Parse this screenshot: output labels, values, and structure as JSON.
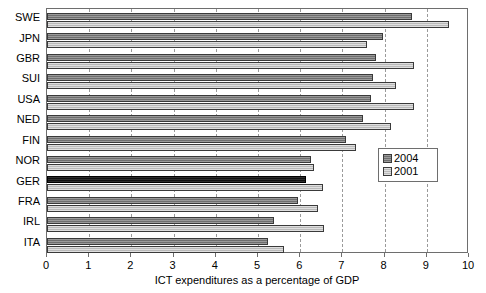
{
  "chart_data": {
    "type": "bar",
    "orientation": "horizontal",
    "title": "",
    "xlabel": "ICT expenditures as a percentage of GDP",
    "ylabel": "",
    "xlim": [
      0,
      10
    ],
    "ylim": null,
    "grid": true,
    "grid_axis": "x",
    "legend_position": "center-right",
    "xticks": [
      "0",
      "1",
      "2",
      "3",
      "4",
      "5",
      "6",
      "7",
      "8",
      "9",
      "10"
    ],
    "categories": [
      "SWE",
      "JPN",
      "GBR",
      "SUI",
      "USA",
      "NED",
      "FIN",
      "NOR",
      "GER",
      "FRA",
      "IRL",
      "ITA"
    ],
    "series": [
      {
        "name": "2004",
        "color": "#6e6e6e",
        "values": [
          8.65,
          7.96,
          7.8,
          7.72,
          7.68,
          7.49,
          7.09,
          6.26,
          6.14,
          5.94,
          5.38,
          5.23
        ]
      },
      {
        "name": "2001",
        "color": "#b9b9b9",
        "values": [
          9.53,
          7.58,
          8.7,
          8.27,
          8.7,
          8.15,
          7.32,
          6.33,
          6.54,
          6.43,
          6.57,
          5.62
        ]
      }
    ],
    "highlighted_category": "GER",
    "highlight_color": "#101010"
  },
  "legend": {
    "entries": [
      {
        "label": "2004",
        "swatch_name": "legend-swatch-2004"
      },
      {
        "label": "2001",
        "swatch_name": "legend-swatch-2001"
      }
    ]
  }
}
